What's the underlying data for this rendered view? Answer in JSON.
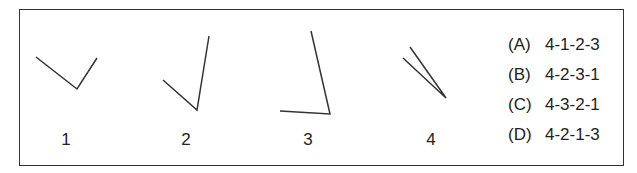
{
  "figures": [
    {
      "label": "1",
      "points": [
        [
          36,
          57
        ],
        [
          77,
          89
        ],
        [
          97,
          58
        ]
      ]
    },
    {
      "label": "2",
      "points": [
        [
          163,
          80
        ],
        [
          197,
          110
        ],
        [
          209,
          36
        ]
      ]
    },
    {
      "label": "3",
      "points": [
        [
          311,
          31
        ],
        [
          330,
          114
        ],
        [
          280,
          111
        ]
      ]
    },
    {
      "label": "4",
      "points": [
        [
          410,
          47
        ],
        [
          446,
          98
        ],
        [
          403,
          58
        ]
      ]
    }
  ],
  "options": [
    {
      "letter": "(A)",
      "sequence": "4-1-2-3"
    },
    {
      "letter": "(B)",
      "sequence": "4-2-3-1"
    },
    {
      "letter": "(C)",
      "sequence": "4-3-2-1"
    },
    {
      "letter": "(D)",
      "sequence": "4-2-1-3"
    }
  ],
  "colors": {
    "line": "#333333",
    "text": "#222222",
    "border": "#333333"
  }
}
